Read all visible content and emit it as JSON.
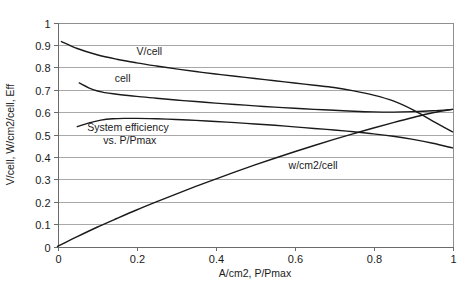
{
  "chart_data": {
    "type": "line",
    "title": "",
    "xlabel": "A/cm2, P/Pmax",
    "ylabel": "V/cell, W/cm2/cell, Eff",
    "xlim": [
      0,
      1
    ],
    "ylim": [
      0,
      1
    ],
    "xticks": [
      "0",
      "0.2",
      "0.4",
      "0.6",
      "0.8",
      "1"
    ],
    "xtick_values": [
      0,
      0.2,
      0.4,
      0.6,
      0.8,
      1
    ],
    "yticks": [
      "0",
      "0.1",
      "0.2",
      "0.3",
      "0.4",
      "0.5",
      "0.6",
      "0.7",
      "0.8",
      "0.9",
      "1"
    ],
    "ytick_values": [
      0,
      0.1,
      0.2,
      0.3,
      0.4,
      0.5,
      0.6,
      0.7,
      0.8,
      0.9,
      1
    ],
    "grid": "horizontal",
    "legend": "inline-annotations",
    "series": [
      {
        "name": "V/cell",
        "label": "V/cell",
        "label_x": 0.2,
        "label_y": 0.855,
        "x": [
          0.01,
          0.05,
          0.1,
          0.15,
          0.2,
          0.25,
          0.3,
          0.35,
          0.4,
          0.45,
          0.5,
          0.55,
          0.6,
          0.65,
          0.7,
          0.75,
          0.8,
          0.85,
          0.9,
          0.95,
          1.0
        ],
        "y": [
          0.915,
          0.884,
          0.856,
          0.836,
          0.82,
          0.806,
          0.793,
          0.781,
          0.77,
          0.76,
          0.75,
          0.74,
          0.73,
          0.72,
          0.71,
          0.695,
          0.676,
          0.65,
          0.61,
          0.56,
          0.512
        ]
      },
      {
        "name": "cell",
        "label": "cell",
        "label_x": 0.145,
        "label_y": 0.735,
        "x": [
          0.055,
          0.09,
          0.12,
          0.15,
          0.2,
          0.25,
          0.3,
          0.35,
          0.4,
          0.45,
          0.5,
          0.55,
          0.6,
          0.65,
          0.7,
          0.75,
          0.8,
          0.85,
          0.9,
          0.95,
          1.0
        ],
        "y": [
          0.73,
          0.7,
          0.687,
          0.68,
          0.67,
          0.662,
          0.654,
          0.647,
          0.64,
          0.634,
          0.628,
          0.622,
          0.617,
          0.612,
          0.608,
          0.604,
          0.601,
          0.6,
          0.602,
          0.606,
          0.612
        ]
      },
      {
        "name": "System efficiency vs. P/Pmax",
        "label": "System efficiency\nvs. P/Pmax",
        "label_line1": "System efficiency",
        "label_line2": "vs. P/Pmax",
        "label_x": 0.075,
        "label_y": 0.517,
        "x": [
          0.05,
          0.08,
          0.11,
          0.14,
          0.17,
          0.2,
          0.25,
          0.3,
          0.35,
          0.4,
          0.45,
          0.5,
          0.55,
          0.6,
          0.65,
          0.7,
          0.75,
          0.8,
          0.85,
          0.9,
          0.95,
          1.0
        ],
        "y": [
          0.535,
          0.552,
          0.564,
          0.57,
          0.572,
          0.572,
          0.57,
          0.567,
          0.563,
          0.558,
          0.553,
          0.547,
          0.541,
          0.534,
          0.527,
          0.52,
          0.512,
          0.503,
          0.492,
          0.478,
          0.461,
          0.44
        ]
      },
      {
        "name": "w/cm2/cell",
        "label": "w/cm2/cell",
        "label_x": 0.585,
        "label_y": 0.345,
        "x": [
          0.0,
          0.05,
          0.1,
          0.15,
          0.2,
          0.25,
          0.3,
          0.35,
          0.4,
          0.45,
          0.5,
          0.55,
          0.6,
          0.65,
          0.7,
          0.75,
          0.8,
          0.85,
          0.9,
          0.95,
          1.0
        ],
        "y": [
          0.0,
          0.044,
          0.086,
          0.125,
          0.163,
          0.199,
          0.234,
          0.268,
          0.301,
          0.333,
          0.364,
          0.394,
          0.423,
          0.451,
          0.478,
          0.504,
          0.529,
          0.553,
          0.576,
          0.597,
          0.612
        ]
      }
    ]
  }
}
